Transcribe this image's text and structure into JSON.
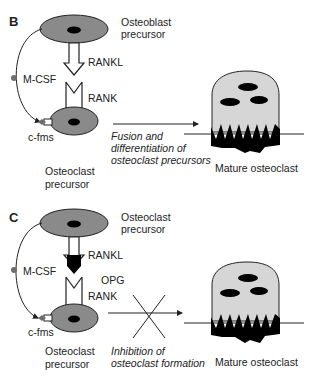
{
  "colors": {
    "cell_fill": "#8a8a8a",
    "nucleus": "#000000",
    "mature_cell_fill": "#d6d6d6",
    "line": "#222222",
    "mcsf_dot": "#6e6e6e"
  },
  "panels": [
    {
      "letter": "B",
      "top_cell_line1": "Osteoblast",
      "top_cell_line2": "precursor",
      "ligand": "RANKL",
      "receptor": "RANK",
      "growth_factor": "M-CSF",
      "growth_receptor": "c-fms",
      "bottom_cell_line1": "Osteoclast",
      "bottom_cell_line2": "precursor",
      "process_line1": "Fusion and",
      "process_line2": "differentiation of",
      "process_line3": "osteoclast precursors",
      "result": "Mature osteoclast"
    },
    {
      "letter": "C",
      "top_cell_line1": "Osteoclast",
      "top_cell_line2": "precursor",
      "ligand": "RANKL",
      "inhibitor": "OPG",
      "receptor": "RANK",
      "growth_factor": "M-CSF",
      "growth_receptor": "c-fms",
      "bottom_cell_line1": "Osteoclast",
      "bottom_cell_line2": "precursor",
      "process_line1": "Inhibition of",
      "process_line2": "osteoclast formation",
      "result": "Mature osteoclast"
    }
  ]
}
